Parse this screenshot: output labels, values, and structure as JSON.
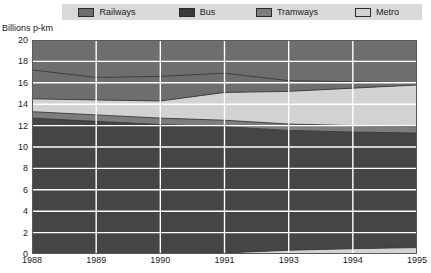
{
  "legend": {
    "items": [
      {
        "label": "Railways",
        "color": "#6e6e6e",
        "icon": "legend-swatch-icon"
      },
      {
        "label": "Bus",
        "color": "#4a4a4a",
        "icon": "legend-swatch-icon"
      },
      {
        "label": "Tramways",
        "color": "#8f8f8f",
        "icon": "legend-swatch-icon"
      },
      {
        "label": "Metro",
        "color": "#c9c9c9",
        "icon": "legend-swatch-icon"
      }
    ],
    "background": "#d9d9d9"
  },
  "axis": {
    "y_title": "Billions p-km",
    "y_ticks": [
      "20",
      "18",
      "16",
      "14",
      "12",
      "10",
      "8",
      "6",
      "4",
      "2",
      "0"
    ],
    "x_ticks": [
      "1988",
      "1989",
      "1990",
      "1991",
      "1993",
      "1994",
      "1995"
    ]
  },
  "chart_data": {
    "type": "area",
    "title": "",
    "subtitle": "",
    "xlabel": "",
    "ylabel": "Billions p-km",
    "ylim": [
      0,
      20
    ],
    "yticks": [
      0,
      2,
      4,
      6,
      8,
      10,
      12,
      14,
      16,
      18,
      20
    ],
    "grid": true,
    "grid_color": "#ffffff",
    "legend_position": "top",
    "stacked": true,
    "stack_order_bottom_to_top": [
      "Metro",
      "Bus",
      "Tramways",
      "Railways"
    ],
    "x": [
      "1988",
      "1989",
      "1990",
      "1991",
      "1993",
      "1994",
      "1995"
    ],
    "categories": [
      "1988",
      "1989",
      "1990",
      "1991",
      "1993",
      "1994",
      "1995"
    ],
    "series": [
      {
        "name": "Metro",
        "color": "#c9c9c9",
        "note": "bottom band plus the large light band between Tramways and Railways",
        "values_bottom_band": [
          0.0,
          0.0,
          0.0,
          0.1,
          0.35,
          0.5,
          0.6
        ],
        "values_upper_band": [
          2.6,
          3.0,
          3.2,
          3.4,
          3.6,
          3.8,
          3.9
        ]
      },
      {
        "name": "Bus",
        "color": "#4a4a4a",
        "values": [
          12.7,
          12.4,
          12.1,
          11.8,
          11.2,
          10.9,
          10.7
        ]
      },
      {
        "name": "Tramways",
        "color": "#8f8f8f",
        "values": [
          0.6,
          0.6,
          0.6,
          0.6,
          0.6,
          0.6,
          0.6
        ]
      },
      {
        "name": "Railways",
        "color": "#6e6e6e",
        "values": [
          3.1,
          2.5,
          2.4,
          2.6,
          1.9,
          1.6,
          1.2
        ]
      }
    ],
    "cumulative_tops": {
      "metro_bottom": [
        0.0,
        0.0,
        0.0,
        0.1,
        0.35,
        0.5,
        0.6
      ],
      "bus_top": [
        12.7,
        12.4,
        12.1,
        11.9,
        11.55,
        11.4,
        11.3
      ],
      "tramways_top": [
        13.3,
        13.0,
        12.7,
        12.5,
        12.15,
        12.0,
        11.9
      ],
      "metro_top": [
        14.5,
        14.4,
        14.3,
        15.1,
        15.2,
        15.5,
        15.8
      ],
      "railways_top": [
        17.2,
        16.5,
        16.6,
        16.9,
        16.2,
        16.1,
        16.0
      ]
    }
  }
}
